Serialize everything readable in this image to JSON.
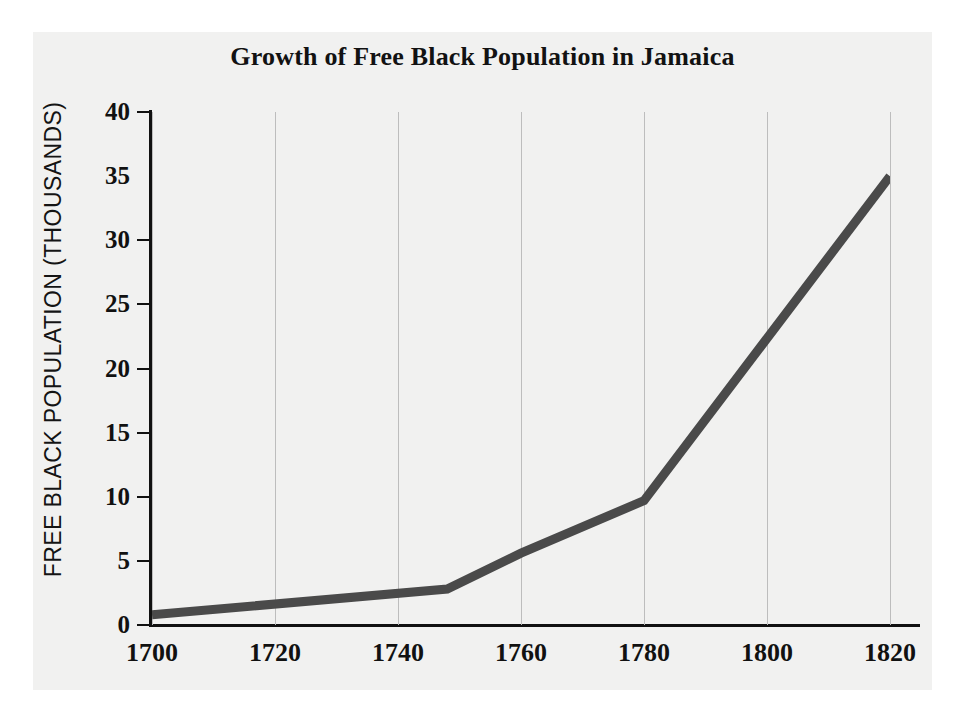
{
  "figure": {
    "background_color": "#ffffff",
    "panel_color": "#f1f1f0",
    "axis_color": "#111111",
    "grid_color": "#bdbdbd",
    "line_color": "#4a4a4a"
  },
  "chart_data": {
    "type": "line",
    "title": "Growth of Free Black Population in Jamaica",
    "xlabel": "",
    "ylabel": "FREE BLACK POPULATION (THOUSANDS)",
    "xlim": [
      1700,
      1820
    ],
    "ylim": [
      0,
      40
    ],
    "xticks": [
      1700,
      1720,
      1740,
      1760,
      1780,
      1800,
      1820
    ],
    "xtick_labels": [
      "1700",
      "1720",
      "1740",
      "1760",
      "1780",
      "1800",
      "1820"
    ],
    "yticks": [
      0,
      5,
      10,
      15,
      20,
      25,
      30,
      35,
      40
    ],
    "ytick_labels": [
      "0",
      "5",
      "10",
      "15",
      "20",
      "25",
      "30",
      "35",
      "40"
    ],
    "grid": "vertical",
    "legend": "none",
    "series": [
      {
        "name": "Free Black Population",
        "x": [
          1700,
          1748,
          1760,
          1780,
          1820
        ],
        "values": [
          0.8,
          2.8,
          5.6,
          9.7,
          35.0
        ]
      }
    ]
  }
}
